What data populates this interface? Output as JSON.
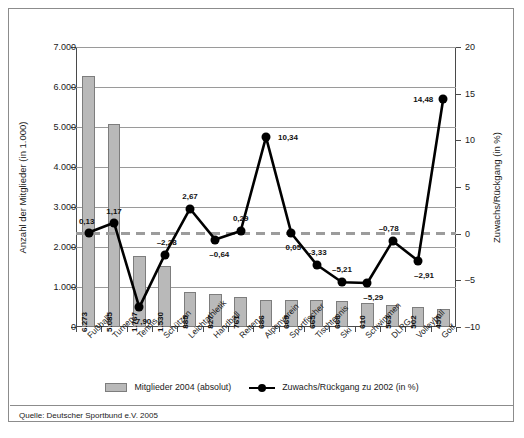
{
  "chart_data": {
    "type": "bar",
    "title": "",
    "categories": [
      "Fußball",
      "Turnen",
      "Tennis",
      "Schützen",
      "Leichtathletik",
      "Handball",
      "Reiten",
      "Alpenverein",
      "Sportfischer",
      "Tischtennis",
      "Ski",
      "Schwimmen",
      "DLRG",
      "Volleyball",
      "Golf"
    ],
    "series": [
      {
        "name": "Mitglieder 2004 (absolut)",
        "type": "bar",
        "axis": "left",
        "values": [
          6273,
          5085,
          1767,
          1530,
          885,
          827,
          761,
          686,
          669,
          665,
          660,
          610,
          563,
          502,
          457
        ],
        "value_labels": [
          "6.273",
          "5.085",
          "1.767",
          "1.530",
          "885",
          "827",
          "761",
          "686",
          "669",
          "665",
          "660",
          "610",
          "563",
          "502",
          "457"
        ],
        "color": "#b9b9b9"
      },
      {
        "name": "Zuwachs/Rückgang zu 2002 (in %)",
        "type": "line",
        "axis": "right",
        "values": [
          0.13,
          1.17,
          -7.9,
          -2.28,
          2.67,
          -0.64,
          0.29,
          10.34,
          0.05,
          -3.33,
          -5.21,
          -5.29,
          -0.78,
          -2.91,
          14.48
        ],
        "value_labels": [
          "0,13",
          "1,17",
          "–7,90",
          "–2,28",
          "2,67",
          "–0,64",
          "0,29",
          "10,34",
          "0,05",
          "–3,33",
          "–5,21",
          "–5,29",
          "–0,78",
          "–2,91",
          "14,48"
        ],
        "color": "#000000"
      }
    ],
    "ylabel": "Anzahl der Mitglieder (in 1.000)",
    "ylabel_right": "Zuwachs/Rückgang (in %)",
    "xlabel": "",
    "ylim": [
      0,
      7000
    ],
    "ylim_right": [
      -10,
      20
    ],
    "yticks": [
      0,
      1000,
      2000,
      3000,
      4000,
      5000,
      6000,
      7000
    ],
    "ytick_labels": [
      "0",
      "1.000",
      "2.000",
      "3.000",
      "4.000",
      "5.000",
      "6.000",
      "7.000"
    ],
    "yticks_right": [
      -10,
      -5,
      0,
      5,
      10,
      15,
      20
    ],
    "ytick_labels_right": [
      "–10",
      "–5",
      "0",
      "5",
      "10",
      "15",
      "20"
    ],
    "grid": true,
    "legend_position": "bottom",
    "zero_reference_line": 0
  },
  "legend": {
    "bars_label": "Mitglieder 2004 (absolut)",
    "line_label": "Zuwachs/Rückgang zu 2002 (in %)"
  },
  "source": {
    "text": "Quelle: Deutscher Sportbund e.V. 2005"
  }
}
